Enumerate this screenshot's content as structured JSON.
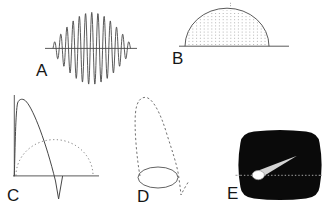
{
  "figure": {
    "background": "#ffffff",
    "ink": "#474747",
    "dot_ink": "#8d8d8d",
    "dash_ink": "#616161"
  },
  "panels": {
    "a": {
      "label": "A",
      "axis_path": "M 45 48.4 H 137",
      "wave": {
        "x_start": 53,
        "x_end": 130.5,
        "center_y": 48.4,
        "cycles": 12.5,
        "amp_max": 36,
        "amp_min": 4.5
      }
    },
    "b": {
      "label": "B",
      "baseline_path": "M 179 46.2 H 289",
      "dome_path": "M 185 46.2 A 42 38 0 0 1 269 46.2",
      "apex_tick_path": "M 230.5 2.8 V 7.2",
      "dome": {
        "cx": 227,
        "cy": 46.2,
        "rx": 42,
        "ry": 38,
        "spacing": 3.8
      }
    },
    "c": {
      "label": "C",
      "axes_path": "M 14.3 95 V 176.4 M 13 175.9 H 99",
      "solid_path": "M 14.3 176 C 15.2 146, 15.6 112, 17.6 103 C 19 98.4, 23.6 98, 26.6 102 C 33.6 110, 46 142, 55.5 181 L 58.6 199 L 62.6 176",
      "dotted_arc_path": "M 16 175.6 A 38.5 36 0 0 1 93 175.6"
    },
    "d": {
      "label": "D",
      "dashed_path": "M 140 176 C 137 160, 134 128, 135.5 113 C 136.5 101, 141 96.5, 146.5 97.5 C 153 99, 160.5 113, 166.5 133 C 171.5 149, 176.5 163, 178.5 175 C 179.5 182, 180.5 190, 181 195 C 183.2 190.6, 186 185.4, 189 181",
      "ellipse_path": "M 138 177.5 A 20 10.5 0 1 0 178 177.5 A 20 10.5 0 1 0 138 177.5"
    },
    "e": {
      "label": "E",
      "screen_color": "#0a0a0a",
      "screen_path": "M 254 131.5 Q 280 128.4 306 131.5 Q 318.5 133 319.6 143 Q 323.6 165 319.6 187 Q 318.5 197 306 198.6 Q 280 201.6 254 198.6 Q 241.5 197 240.4 187 Q 236.4 165 240.4 143 Q 241.5 133 254 131.5 Z",
      "scanline_outer_path": "M 235.5 175.3 H 240.5 M 319.8 175.3 H 322.8",
      "scanline_inner_path": "M 240.5 175.3 H 320",
      "scanline_color": "#b8b8b8",
      "comet": {
        "tail_path": "M 258 179.6 L 256.4 171.2 L 297 155.8 Z",
        "tail_color": "#d4d4d4",
        "head_path": "M 252.2 175.1 A 6.1 4.6 0 1 0 264.4 175.1 A 6.1 4.6 0 1 0 252.2 175.1",
        "head_color": "#fdfdfd",
        "head_outline": "#8f8f8f"
      }
    }
  }
}
